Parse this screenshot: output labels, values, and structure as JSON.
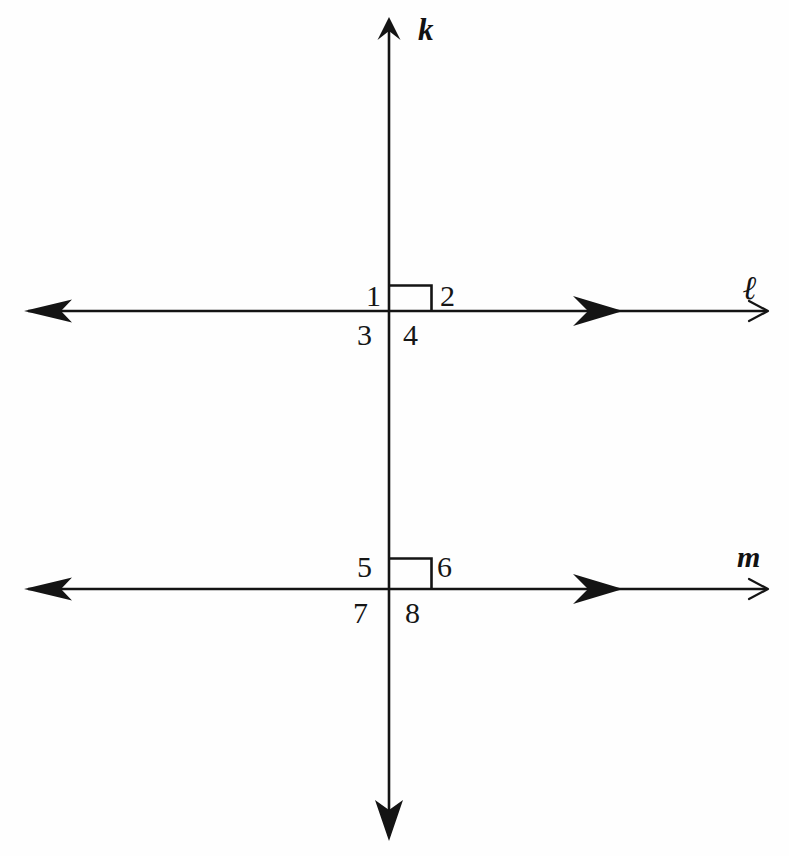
{
  "figure": {
    "background_color": "#fefefe",
    "stroke_color": "#141414"
  },
  "lines": [
    {
      "id": "k",
      "label": "k",
      "orientation": "vertical",
      "description": "transversal line k, vertical, arrowheads at both ends",
      "arrowheads": [
        "top",
        "bottom"
      ]
    },
    {
      "id": "l",
      "label": "ℓ",
      "orientation": "horizontal",
      "description": "line l, horizontal, upper of the two parallel lines",
      "arrowheads": [
        "left",
        "right"
      ]
    },
    {
      "id": "m",
      "label": "m",
      "orientation": "horizontal",
      "description": "line m, horizontal, lower of the two parallel lines",
      "arrowheads": [
        "left",
        "right"
      ]
    }
  ],
  "intersections": [
    {
      "id": "upper",
      "lines": [
        "k",
        "l"
      ],
      "right_angle_marker": true,
      "angles": [
        {
          "number": "1",
          "position": "upper-left"
        },
        {
          "number": "2",
          "position": "upper-right"
        },
        {
          "number": "3",
          "position": "lower-left"
        },
        {
          "number": "4",
          "position": "lower-right"
        }
      ]
    },
    {
      "id": "lower",
      "lines": [
        "k",
        "m"
      ],
      "right_angle_marker": true,
      "angles": [
        {
          "number": "5",
          "position": "upper-left"
        },
        {
          "number": "6",
          "position": "upper-right"
        },
        {
          "number": "7",
          "position": "lower-left"
        },
        {
          "number": "8",
          "position": "lower-right"
        }
      ]
    }
  ],
  "labels": {
    "k": "k",
    "l": "ℓ",
    "m": "m",
    "a1": "1",
    "a2": "2",
    "a3": "3",
    "a4": "4",
    "a5": "5",
    "a6": "6",
    "a7": "7",
    "a8": "8"
  }
}
